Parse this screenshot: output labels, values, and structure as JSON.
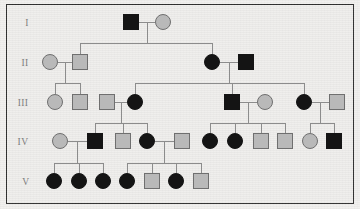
{
  "figure": {
    "canvas": {
      "width": 360,
      "height": 209
    },
    "background_color": "#efeeec",
    "border_color": "#2e2e2e",
    "line_color": "#8c8c8c",
    "affected_color": "#141414",
    "unaffected_color": "#b9b9b9",
    "unaffected_stroke": "#6f6f6f",
    "symbol_size": 15
  },
  "generation_labels": [
    {
      "id": "gen-label-1",
      "text": "I",
      "x": 27,
      "y": 26
    },
    {
      "id": "gen-label-2",
      "text": "II",
      "x": 25,
      "y": 66
    },
    {
      "id": "gen-label-3",
      "text": "III",
      "x": 23,
      "y": 106
    },
    {
      "id": "gen-label-4",
      "text": "IV",
      "x": 23,
      "y": 145
    },
    {
      "id": "gen-label-5",
      "text": "V",
      "x": 26,
      "y": 185
    }
  ],
  "generations": [
    {
      "label": "I",
      "row_y": 22,
      "individuals": [
        {
          "id": "I-1",
          "sex": "male",
          "shape": "square",
          "status": "affected",
          "cx": 131,
          "cy": 22
        },
        {
          "id": "I-2",
          "sex": "female",
          "shape": "circle",
          "status": "unaffected",
          "cx": 163,
          "cy": 22
        }
      ]
    },
    {
      "label": "II",
      "row_y": 62,
      "individuals": [
        {
          "id": "II-1",
          "sex": "female",
          "shape": "circle",
          "status": "unaffected",
          "cx": 50,
          "cy": 62
        },
        {
          "id": "II-2",
          "sex": "male",
          "shape": "square",
          "status": "unaffected",
          "cx": 80,
          "cy": 62
        },
        {
          "id": "II-3",
          "sex": "female",
          "shape": "circle",
          "status": "affected",
          "cx": 212,
          "cy": 62
        },
        {
          "id": "II-4",
          "sex": "male",
          "shape": "square",
          "status": "affected",
          "cx": 246,
          "cy": 62
        }
      ]
    },
    {
      "label": "III",
      "row_y": 102,
      "individuals": [
        {
          "id": "III-1",
          "sex": "female",
          "shape": "circle",
          "status": "unaffected",
          "cx": 55,
          "cy": 102
        },
        {
          "id": "III-2",
          "sex": "male",
          "shape": "square",
          "status": "unaffected",
          "cx": 80,
          "cy": 102
        },
        {
          "id": "III-3",
          "sex": "male",
          "shape": "square",
          "status": "unaffected",
          "cx": 107,
          "cy": 102
        },
        {
          "id": "III-4",
          "sex": "female",
          "shape": "circle",
          "status": "affected",
          "cx": 135,
          "cy": 102
        },
        {
          "id": "III-5",
          "sex": "male",
          "shape": "square",
          "status": "affected",
          "cx": 232,
          "cy": 102
        },
        {
          "id": "III-6",
          "sex": "female",
          "shape": "circle",
          "status": "unaffected",
          "cx": 265,
          "cy": 102
        },
        {
          "id": "III-7",
          "sex": "female",
          "shape": "circle",
          "status": "affected",
          "cx": 304,
          "cy": 102
        },
        {
          "id": "III-8",
          "sex": "male",
          "shape": "square",
          "status": "unaffected",
          "cx": 337,
          "cy": 102
        }
      ]
    },
    {
      "label": "IV",
      "row_y": 141,
      "individuals": [
        {
          "id": "IV-1",
          "sex": "female",
          "shape": "circle",
          "status": "unaffected",
          "cx": 60,
          "cy": 141
        },
        {
          "id": "IV-2",
          "sex": "male",
          "shape": "square",
          "status": "affected",
          "cx": 95,
          "cy": 141
        },
        {
          "id": "IV-3",
          "sex": "male",
          "shape": "square",
          "status": "unaffected",
          "cx": 123,
          "cy": 141
        },
        {
          "id": "IV-4",
          "sex": "female",
          "shape": "circle",
          "status": "affected",
          "cx": 147,
          "cy": 141
        },
        {
          "id": "IV-5",
          "sex": "male",
          "shape": "square",
          "status": "unaffected",
          "cx": 182,
          "cy": 141
        },
        {
          "id": "IV-6",
          "sex": "female",
          "shape": "circle",
          "status": "affected",
          "cx": 210,
          "cy": 141
        },
        {
          "id": "IV-7",
          "sex": "female",
          "shape": "circle",
          "status": "affected",
          "cx": 235,
          "cy": 141
        },
        {
          "id": "IV-8",
          "sex": "male",
          "shape": "square",
          "status": "unaffected",
          "cx": 261,
          "cy": 141
        },
        {
          "id": "IV-9",
          "sex": "male",
          "shape": "square",
          "status": "unaffected",
          "cx": 285,
          "cy": 141
        },
        {
          "id": "IV-10",
          "sex": "female",
          "shape": "circle",
          "status": "unaffected",
          "cx": 310,
          "cy": 141
        },
        {
          "id": "IV-11",
          "sex": "male",
          "shape": "square",
          "status": "affected",
          "cx": 334,
          "cy": 141
        }
      ]
    },
    {
      "label": "V",
      "row_y": 181,
      "individuals": [
        {
          "id": "V-1",
          "sex": "female",
          "shape": "circle",
          "status": "affected",
          "cx": 54,
          "cy": 181
        },
        {
          "id": "V-2",
          "sex": "female",
          "shape": "circle",
          "status": "affected",
          "cx": 79,
          "cy": 181
        },
        {
          "id": "V-3",
          "sex": "female",
          "shape": "circle",
          "status": "affected",
          "cx": 103,
          "cy": 181
        },
        {
          "id": "V-4",
          "sex": "female",
          "shape": "circle",
          "status": "affected",
          "cx": 127,
          "cy": 181
        },
        {
          "id": "V-5",
          "sex": "male",
          "shape": "square",
          "status": "unaffected",
          "cx": 152,
          "cy": 181
        },
        {
          "id": "V-6",
          "sex": "female",
          "shape": "circle",
          "status": "affected",
          "cx": 176,
          "cy": 181
        },
        {
          "id": "V-7",
          "sex": "male",
          "shape": "square",
          "status": "unaffected",
          "cx": 201,
          "cy": 181
        }
      ]
    }
  ],
  "mating_lines": [
    {
      "id": "mate-I-1-I-2",
      "x1": 139,
      "x2": 155,
      "y": 22
    },
    {
      "id": "mate-II-1-II-2",
      "x1": 58,
      "x2": 72,
      "y": 62
    },
    {
      "id": "mate-II-3-II-4",
      "x1": 220,
      "x2": 238,
      "y": 62
    },
    {
      "id": "mate-III-3-III-4",
      "x1": 115,
      "x2": 127,
      "y": 102
    },
    {
      "id": "mate-III-5-III-6",
      "x1": 240,
      "x2": 257,
      "y": 102
    },
    {
      "id": "mate-III-7-III-8",
      "x1": 312,
      "x2": 329,
      "y": 102
    },
    {
      "id": "mate-IV-1-IV-2",
      "x1": 68,
      "x2": 87,
      "y": 141
    },
    {
      "id": "mate-IV-4-IV-5",
      "x1": 155,
      "x2": 174,
      "y": 141
    }
  ],
  "sibships": [
    {
      "id": "sibship-I",
      "parent_mid_x": 147,
      "drop_from_y": 22,
      "bar_y": 43,
      "bar_x1": 80,
      "bar_x2": 212,
      "children_x": [
        80,
        212
      ],
      "children_top_y": 54
    },
    {
      "id": "sibship-II-left",
      "parent_mid_x": 65,
      "drop_from_y": 62,
      "bar_y": 83,
      "bar_x1": 55,
      "bar_x2": 80,
      "children_x": [
        55,
        80
      ],
      "children_top_y": 94
    },
    {
      "id": "sibship-II-right",
      "parent_mid_x": 229,
      "drop_from_y": 62,
      "bar_y": 83,
      "bar_x1": 135,
      "bar_x2": 304,
      "children_x": [
        135,
        232,
        304
      ],
      "children_top_y": 94
    },
    {
      "id": "sibship-III-left",
      "parent_mid_x": 121,
      "drop_from_y": 102,
      "bar_y": 123,
      "bar_x1": 95,
      "bar_x2": 147,
      "children_x": [
        95,
        123,
        147
      ],
      "children_top_y": 133
    },
    {
      "id": "sibship-III-mid",
      "parent_mid_x": 248,
      "drop_from_y": 102,
      "bar_y": 123,
      "bar_x1": 210,
      "bar_x2": 285,
      "children_x": [
        210,
        235,
        261,
        285
      ],
      "children_top_y": 133
    },
    {
      "id": "sibship-III-right",
      "parent_mid_x": 320,
      "drop_from_y": 102,
      "bar_y": 123,
      "bar_x1": 310,
      "bar_x2": 334,
      "children_x": [
        310,
        334
      ],
      "children_top_y": 133
    },
    {
      "id": "sibship-IV-left",
      "parent_mid_x": 77,
      "drop_from_y": 141,
      "bar_y": 163,
      "bar_x1": 54,
      "bar_x2": 103,
      "children_x": [
        54,
        79,
        103
      ],
      "children_top_y": 173
    },
    {
      "id": "sibship-IV-right",
      "parent_mid_x": 164,
      "drop_from_y": 141,
      "bar_y": 163,
      "bar_x1": 127,
      "bar_x2": 201,
      "children_x": [
        127,
        152,
        176,
        201
      ],
      "children_top_y": 173
    }
  ],
  "legend": {
    "square_meaning": "male",
    "circle_meaning": "female",
    "filled_meaning": "affected",
    "open_meaning": "unaffected"
  }
}
